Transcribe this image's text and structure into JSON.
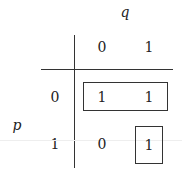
{
  "diagram": {
    "type": "karnaugh-map",
    "column_variable": "q",
    "row_variable": "p",
    "column_headers": [
      "0",
      "1"
    ],
    "row_headers": [
      "0",
      "1"
    ],
    "cells": [
      [
        "1",
        "1"
      ],
      [
        "0",
        "1"
      ]
    ],
    "groups": [
      {
        "name": "row-0-group",
        "cells": [
          [
            0,
            0
          ],
          [
            0,
            1
          ]
        ]
      },
      {
        "name": "cell-1-1-group",
        "cells": [
          [
            1,
            1
          ]
        ]
      }
    ],
    "line_color": "#333333"
  }
}
